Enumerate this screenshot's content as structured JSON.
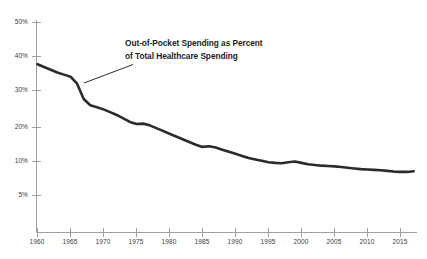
{
  "chart_data": {
    "type": "line",
    "title": "",
    "annotation": {
      "line1": "Out-of-Pocket Spending as Percent",
      "line2": "of Total Healthcare Spending"
    },
    "xlabel": "",
    "ylabel": "",
    "grid": false,
    "legend": "none",
    "xlim": [
      1960,
      2017
    ],
    "ylim": [
      0,
      50
    ],
    "xticks": [
      "1960",
      "1965",
      "1970",
      "1975",
      "1980",
      "1985",
      "1990",
      "1995",
      "2000",
      "2005",
      "2010",
      "2015"
    ],
    "yticks": [
      "50%",
      "40%",
      "30%",
      "20%",
      "10%",
      "5%"
    ],
    "ytick_values": [
      50,
      40,
      30,
      20,
      10,
      5
    ],
    "series": [
      {
        "name": "Out-of-Pocket Spending as Percent of Total Healthcare Spending",
        "color": "#2b2b2b",
        "x": [
          1960,
          1961,
          1962,
          1963,
          1964,
          1965,
          1966,
          1967,
          1968,
          1969,
          1970,
          1971,
          1972,
          1973,
          1974,
          1975,
          1976,
          1977,
          1978,
          1979,
          1980,
          1981,
          1982,
          1983,
          1984,
          1985,
          1986,
          1987,
          1988,
          1989,
          1990,
          1991,
          1992,
          1993,
          1994,
          1995,
          1996,
          1997,
          1998,
          1999,
          2000,
          2001,
          2002,
          2003,
          2004,
          2005,
          2006,
          2007,
          2008,
          2009,
          2010,
          2011,
          2012,
          2013,
          2014,
          2015,
          2016,
          2017
        ],
        "y": [
          38.0,
          37.2,
          36.4,
          35.6,
          35.0,
          34.4,
          32.4,
          28.0,
          26.2,
          25.6,
          25.0,
          24.2,
          23.4,
          22.4,
          21.4,
          20.8,
          20.9,
          20.4,
          19.6,
          18.8,
          18.0,
          17.2,
          16.4,
          15.6,
          14.8,
          14.2,
          14.4,
          14.0,
          13.4,
          12.8,
          12.2,
          11.6,
          11.0,
          10.6,
          10.2,
          9.8,
          9.6,
          9.5,
          9.8,
          10.0,
          9.6,
          9.2,
          9.0,
          8.8,
          8.7,
          8.6,
          8.4,
          8.2,
          8.0,
          7.8,
          7.7,
          7.6,
          7.5,
          7.3,
          7.1,
          7.0,
          7.0,
          7.2
        ]
      }
    ]
  },
  "axis": {
    "y_tick_labels": [
      "50%",
      "40%",
      "30%",
      "20%",
      "10%",
      "5%"
    ],
    "x_tick_labels": [
      "1960",
      "1965",
      "1970",
      "1975",
      "1980",
      "1985",
      "1990",
      "1995",
      "2000",
      "2005",
      "2010",
      "2015"
    ]
  },
  "colors": {
    "line": "#2b2b2b",
    "axis": "#9a9a9a",
    "text": "#3a3a3a",
    "annotation_text": "#1c1c1c",
    "background": "#ffffff"
  }
}
